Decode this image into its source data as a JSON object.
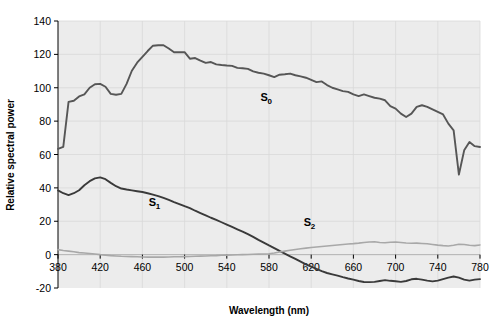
{
  "chart_data": {
    "type": "line",
    "title": "",
    "xlabel": "Wavelength (nm)",
    "ylabel": "Relative spectral power",
    "xlim": [
      380,
      780
    ],
    "ylim": [
      -20,
      140
    ],
    "xticks": [
      380,
      420,
      460,
      500,
      540,
      580,
      620,
      660,
      700,
      740,
      780
    ],
    "yticks": [
      -20,
      0,
      20,
      40,
      60,
      80,
      100,
      120,
      140
    ],
    "grid": true,
    "legend": "inline-annotations",
    "plot_background": "#ececec",
    "x": [
      380,
      385,
      390,
      395,
      400,
      405,
      410,
      415,
      420,
      425,
      430,
      435,
      440,
      445,
      450,
      455,
      460,
      465,
      470,
      475,
      480,
      485,
      490,
      495,
      500,
      505,
      510,
      515,
      520,
      525,
      530,
      535,
      540,
      545,
      550,
      555,
      560,
      565,
      570,
      575,
      580,
      585,
      590,
      595,
      600,
      605,
      610,
      615,
      620,
      625,
      630,
      635,
      640,
      645,
      650,
      655,
      660,
      665,
      670,
      675,
      680,
      685,
      690,
      695,
      700,
      705,
      710,
      715,
      720,
      725,
      730,
      735,
      740,
      745,
      750,
      755,
      760,
      765,
      770,
      775,
      780
    ],
    "series": [
      {
        "name": "S0",
        "label": "S",
        "sublabel": "0",
        "color": "#565656",
        "label_x": 572,
        "label_y": 92,
        "values": [
          63.4,
          64.6,
          91.5,
          92.2,
          94.8,
          96.0,
          100.0,
          102.1,
          102.3,
          100.6,
          96.3,
          95.8,
          96.3,
          102.3,
          110.2,
          115.0,
          118.5,
          122.0,
          125.2,
          125.5,
          125.5,
          123.5,
          121.3,
          121.3,
          121.3,
          117.4,
          117.8,
          116.3,
          114.9,
          115.4,
          114.0,
          113.6,
          113.3,
          113.1,
          111.9,
          111.7,
          111.3,
          109.8,
          109.0,
          108.5,
          107.5,
          106.4,
          107.8,
          108.1,
          108.5,
          107.5,
          106.8,
          106.0,
          104.7,
          103.4,
          103.8,
          101.6,
          100.0,
          99.0,
          98.0,
          97.5,
          96.0,
          95.0,
          96.0,
          95.0,
          94.0,
          93.5,
          92.5,
          89.0,
          87.5,
          84.5,
          82.5,
          84.5,
          88.5,
          89.5,
          88.5,
          87.0,
          85.5,
          84.0,
          78.5,
          74.5,
          48.0,
          62.5,
          67.5,
          65.0,
          64.5
        ]
      },
      {
        "name": "S1",
        "label": "S",
        "sublabel": "1",
        "color": "#3a3a3a",
        "label_x": 466,
        "label_y": 29,
        "values": [
          38.5,
          36.8,
          35.7,
          36.8,
          38.6,
          41.6,
          44.0,
          45.7,
          46.3,
          45.2,
          43.0,
          41.0,
          39.6,
          39.0,
          38.5,
          38.0,
          37.5,
          36.8,
          36.0,
          35.1,
          34.0,
          32.8,
          31.5,
          30.3,
          29.0,
          27.8,
          26.3,
          24.9,
          23.5,
          22.1,
          20.8,
          19.4,
          18.0,
          16.6,
          15.2,
          13.8,
          12.3,
          10.6,
          8.8,
          7.2,
          5.5,
          3.9,
          2.2,
          0.6,
          -1.0,
          -2.6,
          -4.2,
          -5.8,
          -7.2,
          -8.6,
          -9.9,
          -11.0,
          -11.8,
          -12.6,
          -13.5,
          -14.3,
          -15.0,
          -15.8,
          -16.4,
          -16.5,
          -16.3,
          -15.8,
          -15.3,
          -15.7,
          -16.0,
          -16.3,
          -15.8,
          -14.8,
          -14.5,
          -15.0,
          -15.6,
          -16.0,
          -15.6,
          -14.7,
          -13.8,
          -13.1,
          -13.8,
          -15.0,
          -15.6,
          -15.0,
          -14.7
        ]
      },
      {
        "name": "S2",
        "label": "S",
        "sublabel": "2",
        "color": "#a8a8a8",
        "label_x": 613,
        "label_y": 17,
        "values": [
          3.0,
          2.5,
          2.1,
          1.7,
          1.2,
          1.0,
          0.7,
          0.4,
          0.0,
          -0.3,
          -0.6,
          -0.8,
          -1.0,
          -1.1,
          -1.2,
          -1.3,
          -1.4,
          -1.5,
          -1.5,
          -1.5,
          -1.5,
          -1.4,
          -1.3,
          -1.3,
          -1.2,
          -1.1,
          -1.0,
          -0.9,
          -0.8,
          -0.7,
          -0.6,
          -0.4,
          -0.3,
          -0.2,
          -0.1,
          0.0,
          0.1,
          0.2,
          0.3,
          0.4,
          0.5,
          1.0,
          1.6,
          2.1,
          2.6,
          3.1,
          3.5,
          3.9,
          4.3,
          4.6,
          4.9,
          5.2,
          5.5,
          5.8,
          6.1,
          6.4,
          6.6,
          6.9,
          7.3,
          7.6,
          7.7,
          7.3,
          7.1,
          7.4,
          7.6,
          7.3,
          7.0,
          6.8,
          6.9,
          6.7,
          6.5,
          6.1,
          5.7,
          5.4,
          5.2,
          5.6,
          6.2,
          6.1,
          5.6,
          5.4,
          5.8
        ]
      }
    ]
  },
  "axes": {
    "x_title": "Wavelength (nm)",
    "y_title": "Relative spectral power"
  }
}
